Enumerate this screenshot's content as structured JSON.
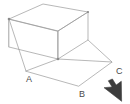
{
  "figure": {
    "background_color": "#ffffff",
    "line_color": "#9a9a9a",
    "faint_line_color": "#b9b9b9",
    "label_color": "#4a4a4a",
    "width": 130,
    "height": 104
  },
  "labels": {
    "a": "A",
    "b": "B",
    "c": "C"
  },
  "label_positions": {
    "a": {
      "x": 26,
      "y": 82
    },
    "b": {
      "x": 79,
      "y": 97
    },
    "c": {
      "x": 116,
      "y": 74
    }
  },
  "geometry": {
    "box_top_face": [
      {
        "x": 9,
        "y": 19
      },
      {
        "x": 43,
        "y": 4
      },
      {
        "x": 88,
        "y": 12
      },
      {
        "x": 58,
        "y": 31
      }
    ],
    "box_front_left_face": [
      {
        "x": 9,
        "y": 19
      },
      {
        "x": 58,
        "y": 31
      },
      {
        "x": 58,
        "y": 59
      },
      {
        "x": 9,
        "y": 47
      }
    ],
    "box_front_right_face": [
      {
        "x": 58,
        "y": 31
      },
      {
        "x": 88,
        "y": 12
      },
      {
        "x": 88,
        "y": 40
      },
      {
        "x": 58,
        "y": 59
      }
    ],
    "base_parallelogram": [
      {
        "x": 26,
        "y": 71
      },
      {
        "x": 58,
        "y": 59
      },
      {
        "x": 112,
        "y": 62
      },
      {
        "x": 79,
        "y": 86
      }
    ],
    "connector_edges": [
      {
        "from": {
          "x": 9,
          "y": 19
        },
        "to": {
          "x": 26,
          "y": 71
        }
      },
      {
        "from": {
          "x": 58,
          "y": 31
        },
        "to": {
          "x": 58,
          "y": 59
        }
      },
      {
        "from": {
          "x": 88,
          "y": 12
        },
        "to": {
          "x": 88,
          "y": 40
        }
      },
      {
        "from": {
          "x": 88,
          "y": 40
        },
        "to": {
          "x": 112,
          "y": 62
        }
      }
    ],
    "vertex_dots": [
      {
        "x": 9,
        "y": 19
      },
      {
        "x": 58,
        "y": 59
      },
      {
        "x": 88,
        "y": 12
      }
    ]
  },
  "cursor": {
    "icon": "mouse-pointer-arrow",
    "x": 104,
    "y": 80,
    "direction": "northwest",
    "color": "#3d3d3d"
  }
}
